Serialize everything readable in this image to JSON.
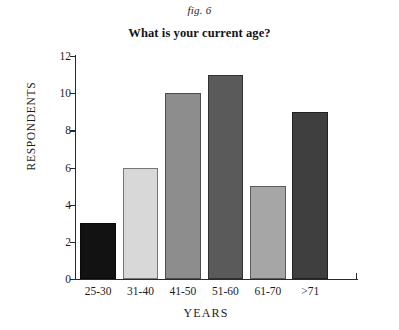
{
  "figure": {
    "fig_label": "fig. 6"
  },
  "chart_data": {
    "type": "bar",
    "title": "What is your current age?",
    "xlabel": "YEARS",
    "ylabel": "RESPONDENTS",
    "categories": [
      "25-30",
      "31-40",
      "41-50",
      "51-60",
      "61-70",
      ">71"
    ],
    "values": [
      3,
      6,
      10,
      11,
      5,
      9
    ],
    "bar_colors": [
      "#121212",
      "#d8d8d8",
      "#8d8d8d",
      "#5a5a5a",
      "#a6a6a6",
      "#3f3f3f"
    ],
    "ylim": [
      0,
      12
    ],
    "yticks": [
      0,
      2,
      4,
      6,
      8,
      10,
      12
    ],
    "ytick_labels": [
      "0",
      "2",
      "4",
      "6",
      "8",
      "10",
      "12"
    ],
    "grid": false,
    "legend": null
  }
}
